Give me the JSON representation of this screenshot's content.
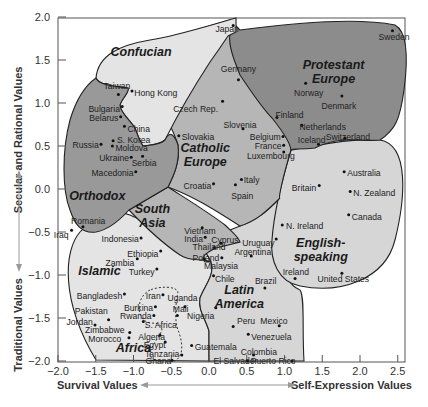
{
  "chart_data": {
    "type": "scatter",
    "title": "",
    "xlabel_left": "Survival Values",
    "xlabel_right": "Self-Expression Values",
    "ylabel_top": "Secular and Rational Values",
    "ylabel_bottom": "Traditional Values",
    "xlim": [
      -2.0,
      2.8
    ],
    "ylim": [
      -2.0,
      2.0
    ],
    "x_ticks": [
      "−2.0",
      "−1.5",
      "−1.0",
      "−0.5",
      "0.0",
      "0.5",
      "1.0",
      "1.5",
      "2.0",
      "2.5"
    ],
    "x_tick_values": [
      -2.0,
      -1.5,
      -1.0,
      -0.5,
      0.0,
      0.5,
      1.0,
      1.5,
      2.0,
      2.5
    ],
    "y_ticks": [
      "2.0",
      "1.5",
      "1.0",
      "0.5",
      "0.0",
      "−0.5",
      "−1.0",
      "−1.5",
      "−2.0"
    ],
    "y_tick_values": [
      2.0,
      1.5,
      1.0,
      0.5,
      0.0,
      -0.5,
      -1.0,
      -1.5,
      -2.0
    ],
    "grid": false,
    "regions": [
      {
        "name": "Confucian",
        "label": "Confucian",
        "lx": -0.9,
        "ly": 1.55,
        "fill": "#e4e4e4"
      },
      {
        "name": "Protestant Europe",
        "label": "Protestant\nEurope",
        "lx": 1.65,
        "ly": 1.4,
        "fill": "#8c8c8c"
      },
      {
        "name": "Catholic Europe",
        "label": "Catholic\nEurope",
        "lx": -0.05,
        "ly": 0.43,
        "fill": "#b6b6b6"
      },
      {
        "name": "Orthodox",
        "label": "Orthodox",
        "lx": -1.48,
        "ly": -0.13,
        "fill": "#999999"
      },
      {
        "name": "South Asia",
        "label": "South\nAsia",
        "lx": -0.75,
        "ly": -0.28,
        "fill": "#b6b6b6"
      },
      {
        "name": "English-speaking",
        "label": "English-\nspeaking",
        "lx": 1.48,
        "ly": -0.68,
        "fill": "#d6d6d6"
      },
      {
        "name": "Islamic",
        "label": "Islamic",
        "lx": -1.45,
        "ly": -1.0,
        "fill": "#e4e4e4"
      },
      {
        "name": "Latin America",
        "label": "Latin\nAmerica",
        "lx": 0.4,
        "ly": -1.22,
        "fill": "#d6d6d6"
      },
      {
        "name": "Africa",
        "label": "Africa",
        "lx": -1.0,
        "ly": -1.9,
        "fill": "none"
      }
    ],
    "points": [
      {
        "name": "Japan",
        "x": 0.32,
        "y": 1.9,
        "lx": 0.24,
        "ly": 1.86,
        "anchor": "middle"
      },
      {
        "name": "Sweden",
        "x": 2.43,
        "y": 1.84,
        "lx": 2.45,
        "ly": 1.77,
        "anchor": "middle"
      },
      {
        "name": "Taiwan",
        "x": -1.2,
        "y": 1.1,
        "lx": -1.22,
        "ly": 1.2,
        "anchor": "middle"
      },
      {
        "name": "Hong Kong",
        "x": -1.02,
        "y": 1.14,
        "lx": -0.99,
        "ly": 1.12,
        "anchor": "start"
      },
      {
        "name": "Germany",
        "x": 0.39,
        "y": 1.27,
        "lx": 0.39,
        "ly": 1.4,
        "anchor": "middle"
      },
      {
        "name": "Czech Rep.",
        "x": 0.18,
        "y": 1.02,
        "lx": 0.12,
        "ly": 0.93,
        "anchor": "end"
      },
      {
        "name": "Norway",
        "x": 1.28,
        "y": 1.23,
        "lx": 1.32,
        "ly": 1.12,
        "anchor": "middle"
      },
      {
        "name": "Denmark",
        "x": 1.76,
        "y": 1.08,
        "lx": 1.72,
        "ly": 0.96,
        "anchor": "middle"
      },
      {
        "name": "Bulgaria",
        "x": -1.15,
        "y": 0.96,
        "lx": -1.18,
        "ly": 0.93,
        "anchor": "end"
      },
      {
        "name": "Belarus",
        "x": -1.17,
        "y": 0.84,
        "lx": -1.2,
        "ly": 0.83,
        "anchor": "end"
      },
      {
        "name": "China",
        "x": -1.12,
        "y": 0.73,
        "lx": -1.08,
        "ly": 0.7,
        "anchor": "start"
      },
      {
        "name": "S. Korea",
        "x": -1.27,
        "y": 0.56,
        "lx": -1.22,
        "ly": 0.57,
        "anchor": "start"
      },
      {
        "name": "Slovakia",
        "x": -0.4,
        "y": 0.62,
        "lx": -0.36,
        "ly": 0.6,
        "anchor": "start"
      },
      {
        "name": "Slovenia",
        "x": 0.45,
        "y": 0.7,
        "lx": 0.41,
        "ly": 0.75,
        "anchor": "middle"
      },
      {
        "name": "Finland",
        "x": 0.9,
        "y": 0.83,
        "lx": 0.88,
        "ly": 0.86,
        "anchor": "start"
      },
      {
        "name": "Netherlands",
        "x": 1.23,
        "y": 0.74,
        "lx": 1.2,
        "ly": 0.72,
        "anchor": "start"
      },
      {
        "name": "Belgium",
        "x": 0.98,
        "y": 0.61,
        "lx": 0.95,
        "ly": 0.61,
        "anchor": "end"
      },
      {
        "name": "Iceland",
        "x": 1.45,
        "y": 0.52,
        "lx": 1.36,
        "ly": 0.57,
        "anchor": "middle"
      },
      {
        "name": "Switzerland",
        "x": 1.8,
        "y": 0.59,
        "lx": 1.84,
        "ly": 0.61,
        "anchor": "middle"
      },
      {
        "name": "Russia",
        "x": -1.43,
        "y": 0.52,
        "lx": -1.46,
        "ly": 0.51,
        "anchor": "end"
      },
      {
        "name": "Moldova",
        "x": -1.28,
        "y": 0.5,
        "lx": -1.24,
        "ly": 0.48,
        "anchor": "start"
      },
      {
        "name": "Ukraine",
        "x": -1.03,
        "y": 0.37,
        "lx": -1.06,
        "ly": 0.36,
        "anchor": "end"
      },
      {
        "name": "Serbia",
        "x": -0.88,
        "y": 0.38,
        "lx": -0.86,
        "ly": 0.3,
        "anchor": "middle"
      },
      {
        "name": "Macedonia",
        "x": -0.97,
        "y": 0.2,
        "lx": -1.0,
        "ly": 0.19,
        "anchor": "end"
      },
      {
        "name": "France",
        "x": 0.99,
        "y": 0.51,
        "lx": 0.96,
        "ly": 0.5,
        "anchor": "end"
      },
      {
        "name": "Luxembourg",
        "x": 0.99,
        "y": 0.43,
        "lx": 0.82,
        "ly": 0.38,
        "anchor": "middle"
      },
      {
        "name": "Croatia",
        "x": 0.06,
        "y": 0.06,
        "lx": 0.03,
        "ly": 0.04,
        "anchor": "end"
      },
      {
        "name": "Italy",
        "x": 0.43,
        "y": 0.11,
        "lx": 0.46,
        "ly": 0.11,
        "anchor": "start"
      },
      {
        "name": "Spain",
        "x": 0.35,
        "y": 0.05,
        "lx": 0.44,
        "ly": -0.08,
        "anchor": "middle"
      },
      {
        "name": "Australia",
        "x": 1.79,
        "y": 0.2,
        "lx": 1.83,
        "ly": 0.19,
        "anchor": "start"
      },
      {
        "name": "Britain",
        "x": 1.46,
        "y": 0.04,
        "lx": 1.42,
        "ly": 0.01,
        "anchor": "end"
      },
      {
        "name": "N. Zealand",
        "x": 1.87,
        "y": -0.03,
        "lx": 1.91,
        "ly": -0.05,
        "anchor": "start"
      },
      {
        "name": "Canada",
        "x": 1.85,
        "y": -0.3,
        "lx": 1.89,
        "ly": -0.32,
        "anchor": "start"
      },
      {
        "name": "N. Ireland",
        "x": 0.97,
        "y": -0.42,
        "lx": 1.02,
        "ly": -0.43,
        "anchor": "start"
      },
      {
        "name": "Romania",
        "x": -1.67,
        "y": -0.44,
        "lx": -1.6,
        "ly": -0.37,
        "anchor": "middle"
      },
      {
        "name": "Iraq",
        "x": -1.82,
        "y": -0.48,
        "lx": -1.86,
        "ly": -0.53,
        "anchor": "end"
      },
      {
        "name": "Indonesia",
        "x": -0.9,
        "y": -0.57,
        "lx": -0.93,
        "ly": -0.58,
        "anchor": "end"
      },
      {
        "name": "Vietnam",
        "x": -0.09,
        "y": -0.45,
        "lx": -0.12,
        "ly": -0.49,
        "anchor": "middle"
      },
      {
        "name": "India",
        "x": -0.05,
        "y": -0.56,
        "lx": -0.08,
        "ly": -0.58,
        "anchor": "end"
      },
      {
        "name": "Cyprus",
        "x": 0.16,
        "y": -0.63,
        "lx": 0.03,
        "ly": -0.59,
        "anchor": "start"
      },
      {
        "name": "Thailand",
        "x": 0.07,
        "y": -0.68,
        "lx": 0.0,
        "ly": -0.68,
        "anchor": "middle"
      },
      {
        "name": "Uruguay",
        "x": 0.89,
        "y": -0.58,
        "lx": 0.87,
        "ly": -0.63,
        "anchor": "end"
      },
      {
        "name": "Argentina",
        "x": 0.56,
        "y": -0.78,
        "lx": 0.58,
        "ly": -0.73,
        "anchor": "middle"
      },
      {
        "name": "Ethiopia",
        "x": -0.64,
        "y": -0.72,
        "lx": -0.67,
        "ly": -0.75,
        "anchor": "end"
      },
      {
        "name": "Poland",
        "x": -0.06,
        "y": -0.81,
        "lx": -0.04,
        "ly": -0.8,
        "anchor": "middle"
      },
      {
        "name": "Malaysia",
        "x": 0.17,
        "y": -0.8,
        "lx": 0.16,
        "ly": -0.89,
        "anchor": "middle"
      },
      {
        "name": "Zambia",
        "x": -0.95,
        "y": -0.81,
        "lx": -0.99,
        "ly": -0.86,
        "anchor": "end"
      },
      {
        "name": "Turkey",
        "x": -0.69,
        "y": -0.93,
        "lx": -0.72,
        "ly": -0.96,
        "anchor": "end"
      },
      {
        "name": "Chile",
        "x": 0.06,
        "y": -1.01,
        "lx": 0.21,
        "ly": -1.05,
        "anchor": "middle"
      },
      {
        "name": "Brazil",
        "x": 0.74,
        "y": -1.15,
        "lx": 0.75,
        "ly": -1.07,
        "anchor": "middle"
      },
      {
        "name": "Ireland",
        "x": 1.14,
        "y": -1.04,
        "lx": 1.15,
        "ly": -0.96,
        "anchor": "middle"
      },
      {
        "name": "United States",
        "x": 1.76,
        "y": -0.98,
        "lx": 1.78,
        "ly": -1.05,
        "anchor": "middle"
      },
      {
        "name": "Bangladesh",
        "x": -1.12,
        "y": -1.22,
        "lx": -1.15,
        "ly": -1.24,
        "anchor": "end"
      },
      {
        "name": "Iran",
        "x": -0.61,
        "y": -1.23,
        "lx": -0.64,
        "ly": -1.24,
        "anchor": "end"
      },
      {
        "name": "Uganda",
        "x": -0.32,
        "y": -1.37,
        "lx": -0.35,
        "ly": -1.27,
        "anchor": "middle"
      },
      {
        "name": "Pakistan",
        "x": -1.33,
        "y": -1.52,
        "lx": -1.56,
        "ly": -1.42,
        "anchor": "middle"
      },
      {
        "name": "Burkina",
        "x": -0.71,
        "y": -1.37,
        "lx": -0.74,
        "ly": -1.38,
        "anchor": "end"
      },
      {
        "name": "Mali",
        "x": -0.42,
        "y": -1.47,
        "lx": -0.48,
        "ly": -1.4,
        "anchor": "start"
      },
      {
        "name": "Rwanda",
        "x": -0.73,
        "y": -1.47,
        "lx": -0.76,
        "ly": -1.48,
        "anchor": "end"
      },
      {
        "name": "Nigeria",
        "x": 0.09,
        "y": -1.38,
        "lx": 0.07,
        "ly": -1.48,
        "anchor": "end"
      },
      {
        "name": "Jordan",
        "x": -1.51,
        "y": -1.58,
        "lx": -1.54,
        "ly": -1.55,
        "anchor": "end"
      },
      {
        "name": "S. Africa",
        "x": -0.87,
        "y": -1.54,
        "lx": -0.85,
        "ly": -1.58,
        "anchor": "start"
      },
      {
        "name": "Peru",
        "x": 0.32,
        "y": -1.6,
        "lx": 0.37,
        "ly": -1.54,
        "anchor": "start"
      },
      {
        "name": "Mexico",
        "x": 0.93,
        "y": -1.59,
        "lx": 0.86,
        "ly": -1.53,
        "anchor": "middle"
      },
      {
        "name": "Zimbabwe",
        "x": -1.05,
        "y": -1.67,
        "lx": -1.38,
        "ly": -1.64,
        "anchor": "middle"
      },
      {
        "name": "Morocco",
        "x": -1.06,
        "y": -1.73,
        "lx": -1.38,
        "ly": -1.74,
        "anchor": "middle"
      },
      {
        "name": "Algeria",
        "x": -0.65,
        "y": -1.7,
        "lx": -0.76,
        "ly": -1.72,
        "anchor": "middle"
      },
      {
        "name": "Venezuela",
        "x": 0.52,
        "y": -1.69,
        "lx": 0.56,
        "ly": -1.72,
        "anchor": "start"
      },
      {
        "name": "Egypt",
        "x": -0.58,
        "y": -1.78,
        "lx": -0.72,
        "ly": -1.81,
        "anchor": "middle"
      },
      {
        "name": "Guatemala",
        "x": -0.23,
        "y": -1.82,
        "lx": -0.19,
        "ly": -1.84,
        "anchor": "start"
      },
      {
        "name": "Tanzania",
        "x": -0.36,
        "y": -1.93,
        "lx": -0.62,
        "ly": -1.92,
        "anchor": "middle"
      },
      {
        "name": "Colombia",
        "x": 0.59,
        "y": -1.93,
        "lx": 0.66,
        "ly": -1.89,
        "anchor": "middle"
      },
      {
        "name": "Ghana",
        "x": -0.49,
        "y": -1.99,
        "lx": -0.67,
        "ly": -2.0,
        "anchor": "middle"
      },
      {
        "name": "El Salvador",
        "x": 0.51,
        "y": -2.0,
        "lx": 0.35,
        "ly": -2.0,
        "anchor": "middle"
      },
      {
        "name": "Puerto Rico",
        "x": 1.1,
        "y": -2.0,
        "lx": 0.85,
        "ly": -2.0,
        "anchor": "middle"
      }
    ]
  }
}
